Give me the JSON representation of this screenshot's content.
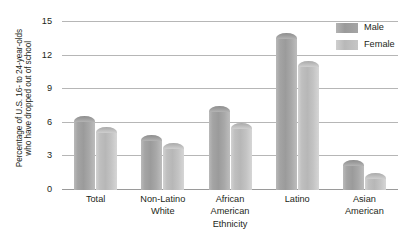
{
  "chart_data": {
    "type": "bar",
    "title": "",
    "xlabel": "Ethnicity",
    "ylabel": "Percentage of U.S. 16- to 24-year-olds who have dropped out of school",
    "ylabel_lines": [
      "Percentage of U.S. 16- to 24-year-olds",
      "who have dropped out of school"
    ],
    "categories": [
      "Total",
      "Non-Latino White",
      "African American",
      "Latino",
      "Asian American"
    ],
    "category_lines": [
      [
        "Total"
      ],
      [
        "Non-Latino",
        "White"
      ],
      [
        "African",
        "American"
      ],
      [
        "Latino"
      ],
      [
        "Asian",
        "American"
      ]
    ],
    "series": [
      {
        "name": "Male",
        "values": [
          6.6,
          4.9,
          7.5,
          14.0,
          2.7
        ],
        "color": "#9b9b9b"
      },
      {
        "name": "Female",
        "values": [
          5.6,
          4.2,
          6.0,
          11.5,
          1.5
        ],
        "color": "#bdbdbd"
      }
    ],
    "ylim": [
      0,
      15
    ],
    "yticks": [
      0,
      3,
      6,
      9,
      12,
      15
    ],
    "ytick_labels": [
      "0",
      "3",
      "6",
      "9",
      "12",
      "15"
    ],
    "grid": true,
    "legend_position": "top-right",
    "legend": [
      "Male",
      "Female"
    ]
  }
}
